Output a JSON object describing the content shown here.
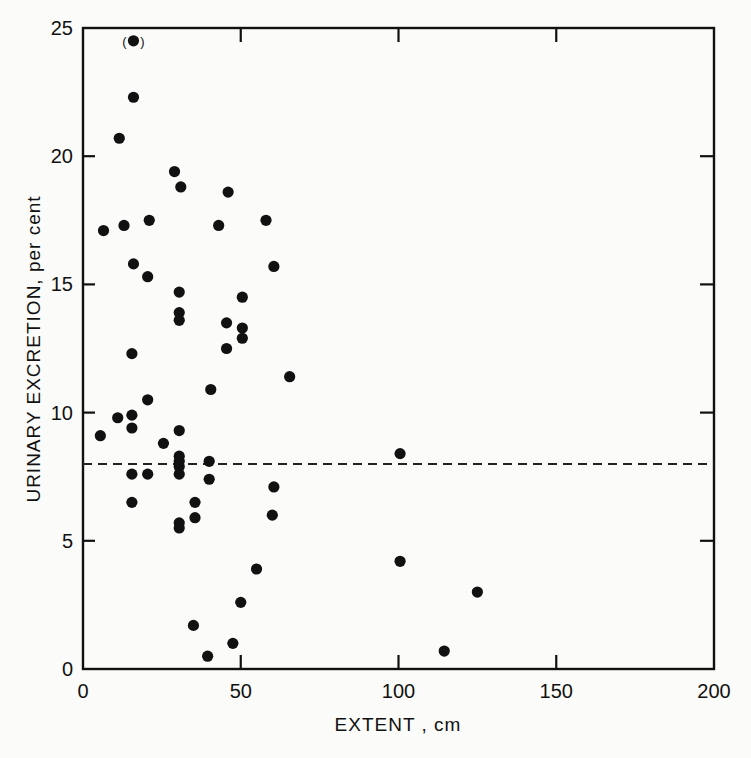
{
  "chart_data": {
    "type": "scatter",
    "title": "",
    "xlabel": "EXTENT , cm",
    "ylabel": "URINARY EXCRETION, per cent",
    "xlim": [
      0,
      200
    ],
    "ylim": [
      0,
      25
    ],
    "x_ticks": [
      "0",
      "50",
      "100",
      "150",
      "200"
    ],
    "y_ticks": [
      "0",
      "5",
      "10",
      "15",
      "20",
      "25"
    ],
    "grid": false,
    "legend": null,
    "reference_line": {
      "type": "horizontal",
      "y": 8,
      "style": "dashed"
    },
    "annotations": [
      {
        "text": "(•)",
        "x": 16,
        "y": 24.5,
        "note": "parenthesised point"
      }
    ],
    "series": [
      {
        "name": "patients",
        "points": [
          [
            16,
            24.5
          ],
          [
            16,
            22.3
          ],
          [
            11.5,
            20.7
          ],
          [
            29,
            19.4
          ],
          [
            31,
            18.8
          ],
          [
            46,
            18.6
          ],
          [
            6.5,
            17.1
          ],
          [
            13,
            17.3
          ],
          [
            21,
            17.5
          ],
          [
            43,
            17.3
          ],
          [
            58,
            17.5
          ],
          [
            16,
            15.8
          ],
          [
            20.5,
            15.3
          ],
          [
            30.5,
            14.7
          ],
          [
            60.5,
            15.7
          ],
          [
            30.5,
            13.9
          ],
          [
            30.5,
            13.6
          ],
          [
            45.5,
            13.5
          ],
          [
            50.5,
            14.5
          ],
          [
            50.5,
            13.3
          ],
          [
            50.5,
            12.9
          ],
          [
            45.5,
            12.5
          ],
          [
            15.5,
            12.3
          ],
          [
            65.5,
            11.4
          ],
          [
            40.5,
            10.9
          ],
          [
            20.5,
            10.5
          ],
          [
            11,
            9.8
          ],
          [
            15.5,
            9.9
          ],
          [
            15.5,
            9.4
          ],
          [
            5.5,
            9.1
          ],
          [
            30.5,
            9.3
          ],
          [
            25.5,
            8.8
          ],
          [
            30.5,
            8.3
          ],
          [
            30.5,
            8.1
          ],
          [
            40,
            8.1
          ],
          [
            30.5,
            7.9
          ],
          [
            15.5,
            7.6
          ],
          [
            20.5,
            7.6
          ],
          [
            30.5,
            7.6
          ],
          [
            40,
            7.4
          ],
          [
            15.5,
            6.5
          ],
          [
            35.5,
            6.5
          ],
          [
            35.5,
            5.9
          ],
          [
            30.5,
            5.7
          ],
          [
            30.5,
            5.5
          ],
          [
            60.5,
            7.1
          ],
          [
            60,
            6.0
          ],
          [
            55,
            3.9
          ],
          [
            50,
            2.6
          ],
          [
            35,
            1.7
          ],
          [
            47.5,
            1.0
          ],
          [
            39.5,
            0.5
          ],
          [
            100.5,
            8.4
          ],
          [
            100.5,
            4.2
          ],
          [
            125,
            3.0
          ],
          [
            114.5,
            0.7
          ]
        ]
      }
    ]
  },
  "labels": {
    "x_axis": "EXTENT , cm",
    "y_axis": "URINARY EXCRETION, per cent",
    "outlier_note": "(   )"
  }
}
